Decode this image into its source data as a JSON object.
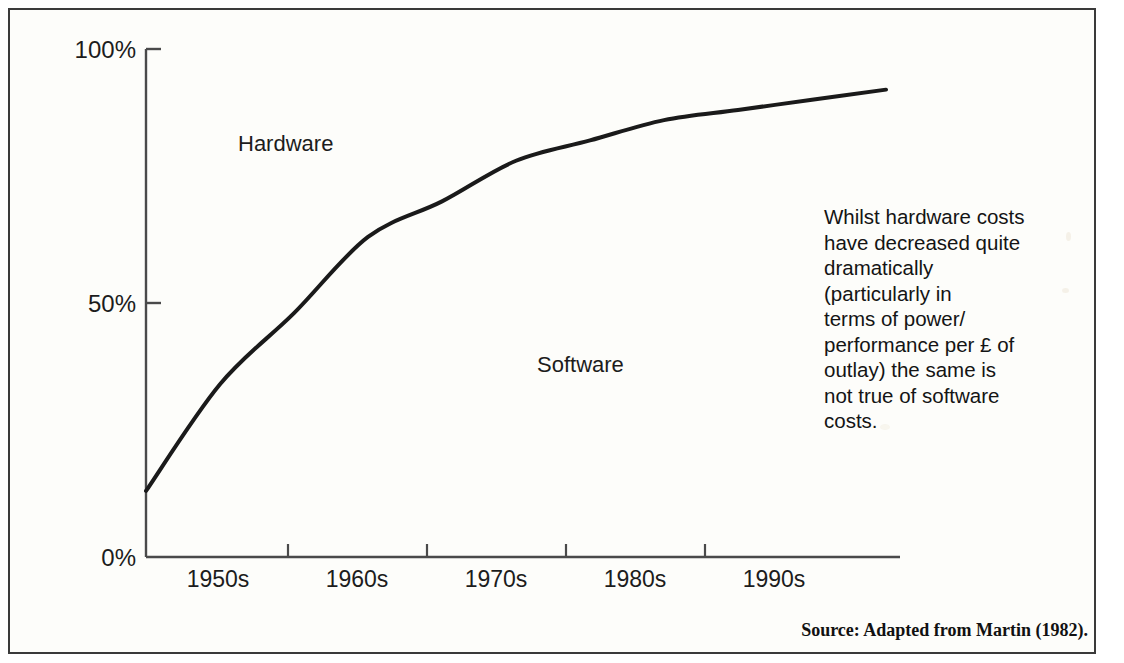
{
  "figure": {
    "source_note": "Source: Adapted from Martin (1982).",
    "commentary": "Whilst hardware costs\nhave decreased quite\ndramatically\n(particularly in\nterms of power/\nperformance per £ of\noutlay) the same is\nnot true of software\ncosts."
  },
  "chart_data": {
    "type": "line",
    "title": "",
    "subtitle": "",
    "xlabel": "",
    "ylabel": "",
    "grid": false,
    "legend_position": "inline-annotations",
    "categories": [
      "1950s",
      "1960s",
      "1970s",
      "1980s",
      "1990s"
    ],
    "xtick_labels": [
      "1950s",
      "1960s",
      "1970s",
      "1980s",
      "1990s"
    ],
    "ytick_labels": [
      "0%",
      "50%",
      "100%"
    ],
    "ylim": [
      0,
      100
    ],
    "yticks": [
      0,
      50,
      100
    ],
    "series": [
      {
        "name": "Software",
        "annotation": "Software",
        "color": "#1a1a1a",
        "description": "Share of total IT cost attributable to software; rises steeply from the mid-1940s and flattens near 92% by the 1990s.",
        "points": [
          {
            "x": "1945",
            "y": 13
          },
          {
            "x": "1950s",
            "y": 34
          },
          {
            "x": "1955",
            "y": 48
          },
          {
            "x": "1960s",
            "y": 63
          },
          {
            "x": "1965",
            "y": 70
          },
          {
            "x": "1970s",
            "y": 78
          },
          {
            "x": "1975",
            "y": 82
          },
          {
            "x": "1980s",
            "y": 86
          },
          {
            "x": "1985",
            "y": 88
          },
          {
            "x": "1990s",
            "y": 90
          },
          {
            "x": "1995",
            "y": 92
          }
        ]
      },
      {
        "name": "Hardware",
        "annotation": "Hardware",
        "color": "#1a1a1a",
        "description": "Region above the curve; hardware share is the complement of the software share, falling from about 87% to about 8%.",
        "points": [
          {
            "x": "1945",
            "y": 87
          },
          {
            "x": "1950s",
            "y": 66
          },
          {
            "x": "1955",
            "y": 52
          },
          {
            "x": "1960s",
            "y": 37
          },
          {
            "x": "1965",
            "y": 30
          },
          {
            "x": "1970s",
            "y": 22
          },
          {
            "x": "1975",
            "y": 18
          },
          {
            "x": "1980s",
            "y": 14
          },
          {
            "x": "1985",
            "y": 12
          },
          {
            "x": "1990s",
            "y": 10
          },
          {
            "x": "1995",
            "y": 8
          }
        ]
      }
    ],
    "annotations": [
      {
        "text": "Hardware",
        "region": "upper-left"
      },
      {
        "text": "Software",
        "region": "lower-right"
      }
    ]
  }
}
